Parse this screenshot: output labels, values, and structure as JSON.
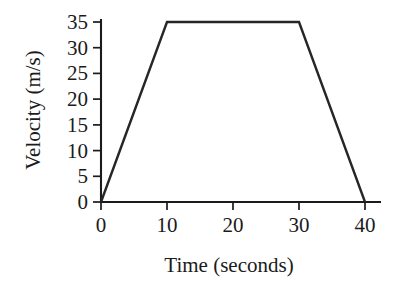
{
  "chart_data": {
    "type": "line",
    "title": "",
    "subtitle": "",
    "xlabel": "Time (seconds)",
    "ylabel": "Velocity (m/s)",
    "xlim": [
      0,
      40
    ],
    "ylim": [
      0,
      35
    ],
    "xticks": [
      0,
      10,
      20,
      30,
      40
    ],
    "yticks": [
      0,
      5,
      10,
      15,
      20,
      25,
      30,
      35
    ],
    "xtick_labels": [
      "0",
      "10",
      "20",
      "30",
      "40"
    ],
    "ytick_labels": [
      "0",
      "5",
      "10",
      "15",
      "20",
      "25",
      "30",
      "35"
    ],
    "grid": false,
    "legend": false,
    "legend_position": "none",
    "annotations": [],
    "line_color": "#262626",
    "axis_color": "#1b1b1b",
    "background_color": "#ffffff",
    "series": [
      {
        "name": "velocity",
        "x": [
          0,
          10,
          30,
          40
        ],
        "values": [
          0,
          35,
          35,
          0
        ],
        "points": [
          {
            "x": 0,
            "y": 0
          },
          {
            "x": 10,
            "y": 35
          },
          {
            "x": 30,
            "y": 35
          },
          {
            "x": 40,
            "y": 0
          }
        ]
      }
    ]
  },
  "axes": {
    "x_title": "Time (seconds)",
    "y_title": "Velocity (m/s)"
  }
}
